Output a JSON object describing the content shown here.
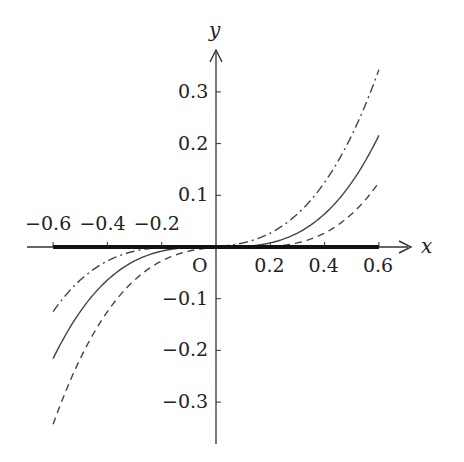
{
  "chart_data": {
    "type": "line",
    "title": "",
    "xlabel": "x",
    "ylabel": "y",
    "origin_label": "O",
    "xlim": [
      -0.6,
      0.6
    ],
    "ylim": [
      -0.35,
      0.35
    ],
    "grid": false,
    "legend": null,
    "x_ticks": [
      -0.6,
      -0.4,
      -0.2,
      0.2,
      0.4,
      0.6
    ],
    "x_tick_labels": [
      "−0.6",
      "−0.4",
      "−0.2",
      "0.2",
      "0.4",
      "0.6"
    ],
    "y_ticks": [
      0.3,
      0.2,
      0.1,
      -0.1,
      -0.2,
      -0.3
    ],
    "y_tick_labels": [
      "0.3",
      "0.2",
      "0.1",
      "−0.1",
      "−0.2",
      "−0.3"
    ],
    "series": [
      {
        "name": "y = (x + 0.1)^3",
        "style": "dash-dot",
        "x": [
          -0.6,
          -0.4,
          -0.2,
          -0.1,
          0.0,
          0.2,
          0.4,
          0.6
        ],
        "values": [
          -0.125,
          -0.027,
          -0.001,
          0.0,
          0.001,
          0.027,
          0.125,
          0.343
        ]
      },
      {
        "name": "y = x^3",
        "style": "solid",
        "x": [
          -0.6,
          -0.4,
          -0.2,
          0.0,
          0.2,
          0.4,
          0.6
        ],
        "values": [
          -0.216,
          -0.064,
          -0.008,
          0.0,
          0.008,
          0.064,
          0.216
        ]
      },
      {
        "name": "y = (x - 0.1)^3",
        "style": "dashed",
        "x": [
          -0.6,
          -0.4,
          -0.2,
          0.0,
          0.1,
          0.2,
          0.4,
          0.6
        ],
        "values": [
          -0.343,
          -0.125,
          -0.027,
          -0.001,
          0.0,
          0.001,
          0.027,
          0.125
        ]
      },
      {
        "name": "y = 0 (bold segment on x-axis)",
        "style": "thick-solid",
        "x": [
          -0.6,
          0.6
        ],
        "values": [
          0,
          0
        ]
      }
    ]
  }
}
